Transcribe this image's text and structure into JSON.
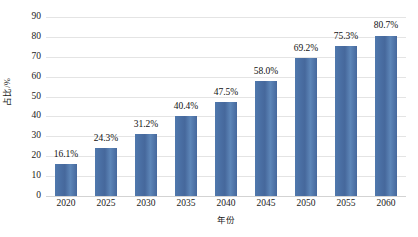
{
  "chart_data": {
    "type": "bar",
    "title": "",
    "xlabel": "年份",
    "ylabel": "占比/%",
    "categories": [
      "2020",
      "2025",
      "2030",
      "2035",
      "2040",
      "2045",
      "2050",
      "2055",
      "2060"
    ],
    "values": [
      16.1,
      24.3,
      31.2,
      40.4,
      47.5,
      58.0,
      69.2,
      75.3,
      80.7
    ],
    "data_labels": [
      "16.1%",
      "24.3%",
      "31.2%",
      "40.4%",
      "47.5%",
      "58.0%",
      "69.2%",
      "75.3%",
      "80.7%"
    ],
    "ylim": [
      0,
      90
    ],
    "yticks": [
      0,
      10,
      20,
      30,
      40,
      50,
      60,
      70,
      80,
      90
    ],
    "ytick_labels": [
      "0",
      "10",
      "20",
      "30",
      "40",
      "50",
      "60",
      "70",
      "80",
      "90"
    ],
    "grid": true,
    "grid_axis": "y",
    "legend": false,
    "legend_position": "none",
    "series": [
      {
        "name": "占比",
        "color": "#4a72a8",
        "values": [
          16.1,
          24.3,
          31.2,
          40.4,
          47.5,
          58.0,
          69.2,
          75.3,
          80.7
        ]
      }
    ]
  },
  "colors": {
    "bar": "#4a72a8",
    "grid": "#e4e4e4",
    "axis": "#d3d3d3",
    "text": "#1a1a1a",
    "background": "#ffffff"
  },
  "caption": {
    "text": ""
  }
}
